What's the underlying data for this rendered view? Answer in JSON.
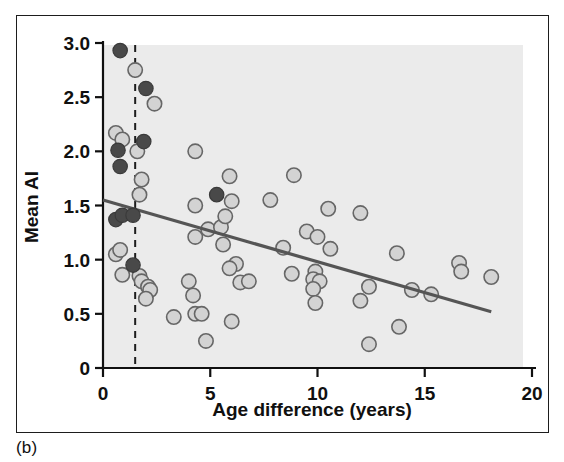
{
  "figure": {
    "panel_label": "(b)",
    "background_color": "#ebebeb",
    "frame_color": "#1d1d1d"
  },
  "chart_data": {
    "type": "scatter",
    "title": "",
    "xlabel": "Age difference (years)",
    "ylabel": "Mean AI",
    "xlim": [
      0,
      20
    ],
    "ylim": [
      0,
      3.0
    ],
    "xticks": [
      0,
      5,
      10,
      15,
      20
    ],
    "xtick_labels": [
      "0",
      "5",
      "10",
      "15",
      "20"
    ],
    "yticks": [
      0,
      0.5,
      1.0,
      1.5,
      2.0,
      2.5,
      3.0
    ],
    "ytick_labels": [
      "0",
      "0.5",
      "1.0",
      "1.5",
      "2.0",
      "2.5",
      "3.0"
    ],
    "grid": false,
    "legend": "none",
    "plot_background": "#ebebeb",
    "series": [
      {
        "name": "open-circles",
        "marker": "open-circle",
        "fill_color": "#d3d3d3",
        "edge_color": "#666666",
        "points": [
          [
            1.5,
            2.75
          ],
          [
            2.4,
            2.44
          ],
          [
            0.6,
            2.17
          ],
          [
            0.9,
            2.11
          ],
          [
            1.6,
            2.0
          ],
          [
            1.8,
            1.74
          ],
          [
            1.7,
            1.6
          ],
          [
            4.3,
            2.0
          ],
          [
            5.9,
            1.77
          ],
          [
            8.9,
            1.78
          ],
          [
            4.3,
            1.5
          ],
          [
            6.0,
            1.54
          ],
          [
            7.8,
            1.55
          ],
          [
            10.5,
            1.47
          ],
          [
            12.0,
            1.43
          ],
          [
            4.9,
            1.28
          ],
          [
            5.5,
            1.3
          ],
          [
            5.7,
            1.4
          ],
          [
            9.5,
            1.26
          ],
          [
            10.0,
            1.21
          ],
          [
            4.3,
            1.21
          ],
          [
            5.6,
            1.14
          ],
          [
            8.4,
            1.11
          ],
          [
            10.6,
            1.1
          ],
          [
            13.7,
            1.06
          ],
          [
            0.6,
            1.05
          ],
          [
            0.8,
            1.09
          ],
          [
            6.2,
            0.96
          ],
          [
            5.9,
            0.92
          ],
          [
            16.6,
            0.97
          ],
          [
            16.7,
            0.89
          ],
          [
            18.1,
            0.84
          ],
          [
            8.8,
            0.87
          ],
          [
            9.9,
            0.89
          ],
          [
            0.9,
            0.86
          ],
          [
            1.7,
            0.85
          ],
          [
            1.8,
            0.8
          ],
          [
            2.1,
            0.75
          ],
          [
            2.2,
            0.72
          ],
          [
            2.0,
            0.64
          ],
          [
            4.0,
            0.8
          ],
          [
            6.4,
            0.79
          ],
          [
            6.8,
            0.8
          ],
          [
            9.8,
            0.82
          ],
          [
            10.1,
            0.8
          ],
          [
            9.8,
            0.73
          ],
          [
            14.4,
            0.72
          ],
          [
            15.3,
            0.68
          ],
          [
            4.2,
            0.67
          ],
          [
            9.9,
            0.6
          ],
          [
            12.0,
            0.62
          ],
          [
            3.3,
            0.47
          ],
          [
            4.3,
            0.5
          ],
          [
            4.6,
            0.5
          ],
          [
            6.0,
            0.43
          ],
          [
            13.8,
            0.38
          ],
          [
            4.8,
            0.25
          ],
          [
            12.4,
            0.22
          ],
          [
            12.4,
            0.75
          ]
        ]
      },
      {
        "name": "filled-circles",
        "marker": "filled-circle",
        "fill_color": "#494949",
        "edge_color": "#3a3a3a",
        "points": [
          [
            0.8,
            2.93
          ],
          [
            2.0,
            2.58
          ],
          [
            0.7,
            2.01
          ],
          [
            1.9,
            2.09
          ],
          [
            0.8,
            1.86
          ],
          [
            5.3,
            1.6
          ],
          [
            0.6,
            1.37
          ],
          [
            0.9,
            1.41
          ],
          [
            1.4,
            1.41
          ],
          [
            1.4,
            0.95
          ]
        ]
      }
    ],
    "regression_line": {
      "name": "fitted-trend-line",
      "color": "#555555",
      "x_start": 0.0,
      "y_start": 1.55,
      "x_end": 18.1,
      "y_end": 0.52
    },
    "reference_line": {
      "name": "vertical-dashed-threshold",
      "orientation": "vertical",
      "x": 1.5,
      "style": "dashed",
      "color": "#1d1d1d"
    }
  }
}
